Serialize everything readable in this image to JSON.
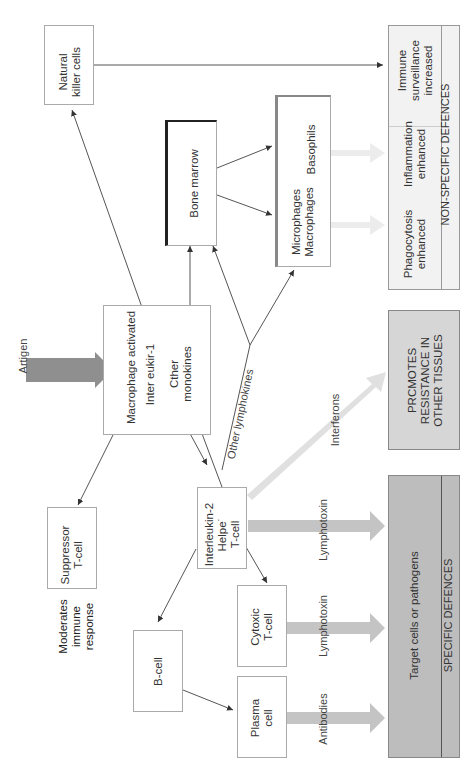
{
  "diagram": {
    "nodes": {
      "natural_killer": "Natural\nkiller cells",
      "bone_marrow": "Bone marrow",
      "basophils": "Basophils",
      "microphages": "Microphages\nMacrophages",
      "macrophage_activated": "Macrophage activated",
      "interleukin1": "Inter eukir-1",
      "other_monokines": "Cther\nmonokines",
      "suppressor": "Suppressor\nT-cell",
      "helper": "Interleukin-2\nHelpe˙\nT-cell",
      "cytotoxic": "Cytoxic\nT-cell",
      "b_cell": "B-cell",
      "plasma": "Plasma\ncell",
      "moderates": "Moderates\nimmune\nresponse"
    },
    "edge_labels": {
      "antigen": "Artigen",
      "other_lymphokines": "Other lymphokines",
      "interferons": "Interferons",
      "lymphotoxin_helper": "Lymphotoxin",
      "lymphotoxin_cytotoxic": "Lymphotoxin",
      "antibodies": "Antibodies"
    },
    "outcomes": {
      "immune_surveillance": "Immune\nsurveillance\nincreased",
      "inflammation": "Inflammation\nenhanced",
      "phagocytosis": "Phagocytosis\nenhanced",
      "non_specific": "NON-SPECIFIC DEFENCES",
      "promotes": "PRCMOTES\nRESISTANCE IN\nOTHER TISSUES",
      "target_cells": "Target cells or pathogens",
      "specific": "SPECIFIC DEFENCES"
    },
    "colors": {
      "specific_fill": "#bdbdbd",
      "promotes_fill": "#d6d6d6",
      "nonspecific_fill": "#f2f2f2",
      "arrow_light": "#e6e6e6",
      "arrow_mid": "#c4c4c4",
      "antigen_arrow": "#8f8f8f"
    }
  }
}
